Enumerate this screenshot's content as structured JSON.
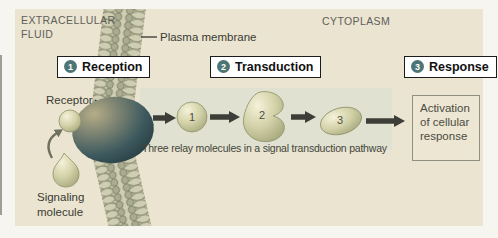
{
  "regions": {
    "extracellular_line1": "EXTRACELLULAR",
    "extracellular_line2": "FLUID",
    "cytoplasm": "CYTOPLASM"
  },
  "labels": {
    "plasma_membrane": "Plasma membrane",
    "receptor": "Receptor",
    "signaling_line1": "Signaling",
    "signaling_line2": "molecule"
  },
  "steps": [
    {
      "num": "1",
      "label": "Reception"
    },
    {
      "num": "2",
      "label": "Transduction"
    },
    {
      "num": "3",
      "label": "Response"
    }
  ],
  "relay": {
    "molecules": [
      "1",
      "2",
      "3"
    ],
    "caption": "Three relay molecules in a signal transduction pathway"
  },
  "response_box": {
    "text": "Activation of cellular response"
  },
  "colors": {
    "panel_bg": "#eae4d1",
    "pathway_band_bg": "#e0e1d0",
    "step_circle": "#4d7575",
    "arrow": "#3e3e38",
    "molecule_green": "#c6c69a",
    "receptor_dark": "#1c3038",
    "region_text": "#60605a"
  }
}
